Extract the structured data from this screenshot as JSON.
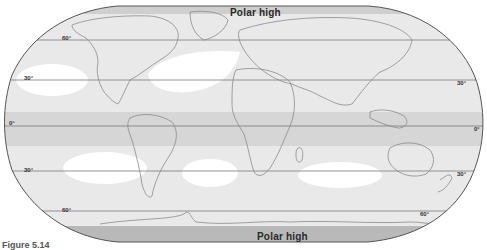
{
  "map": {
    "title_top": "Polar high",
    "title_bottom": "Polar high",
    "projection": "Robinson",
    "latitude_labels": {
      "n60_left": "60°",
      "n30_left": "30°",
      "n30_right": "30°",
      "eq_left": "0°",
      "eq_right": "0°",
      "s30_left": "30°",
      "s30_right": "30°",
      "s60_left": "60°",
      "s60_right": "60°"
    },
    "zones": [
      {
        "name": "polar-high-north",
        "shade": "#c8c8c8"
      },
      {
        "name": "subpolar-low-north",
        "shade": "#e6e6e6"
      },
      {
        "name": "subtropical-high-north",
        "shade": "#ffffff"
      },
      {
        "name": "equatorial-low",
        "shade": "#d2d2d2"
      },
      {
        "name": "subtropical-high-south",
        "shade": "#ffffff"
      },
      {
        "name": "subpolar-low-south",
        "shade": "#e6e6e6"
      },
      {
        "name": "polar-high-south",
        "shade": "#b9b9b9"
      }
    ],
    "colors": {
      "background": "#ebebeb",
      "border": "#555555",
      "latitude_line": "#7a7a7a",
      "coast": "#8a8a8a"
    }
  },
  "caption": "Figure 5.14"
}
